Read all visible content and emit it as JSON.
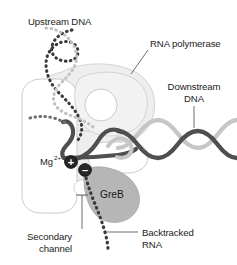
{
  "figure": {
    "background_color": "#ffffff"
  },
  "labels": {
    "upstream_dna": "Upstream DNA",
    "rna_polymerase": "RNA polymerase",
    "downstream_dna_line1": "Downstream",
    "downstream_dna_line2": "DNA",
    "magnesium_base": "Mg",
    "magnesium_charge": "2+",
    "greb": "GreB",
    "secondary_channel_line1": "Secondary",
    "secondary_channel_line2": "channel",
    "backtracked_rna_line1": "Backtracked",
    "backtracked_rna_line2": "RNA",
    "plus_sign": "+",
    "minus_sign": "–"
  },
  "colors": {
    "text": "#1b1b1b",
    "leader_line": "#4a4a4a",
    "polymerase_body_fill": "#eeeeee",
    "polymerase_body_stroke": "#c9c9c9",
    "polymerase_lobe_fill": "#ffffff",
    "polymerase_lobe_stroke": "#bdbdbd",
    "greb_fill": "#b4b4b4",
    "greb_stroke": "#a0a0a0",
    "dna_strand_dark": "#4d4d4d",
    "dna_strand_light": "#c4c4c4",
    "rna_dotted_dark": "#3a3a3a",
    "dotted_light": "#c2c2c2",
    "marker_fill": "#272727",
    "marker_stroke": "#0e0e0e"
  },
  "elements": {
    "upstream_dna_strands": 2,
    "downstream_dna_strands": 2,
    "active_site_markers": [
      "plus",
      "minus"
    ],
    "polymerase_lobes": 4
  }
}
